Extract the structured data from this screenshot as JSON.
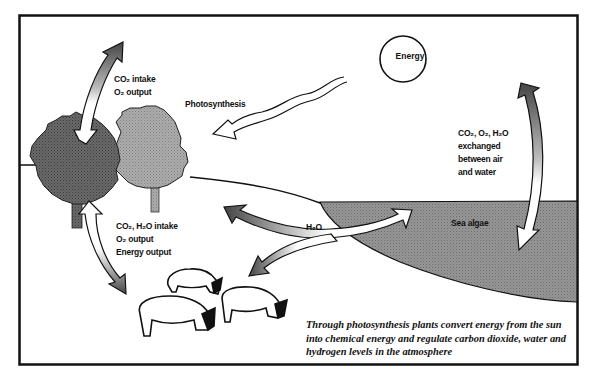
{
  "diagram": {
    "colors": {
      "frame": "#111111",
      "tree_dark": "#5e5e5e",
      "tree_light": "#a4a4a4",
      "sea": "#8f8f8f",
      "arrow_fill": "#ffffff",
      "arrow_shade": "#4a4a4a",
      "outline": "#111111"
    },
    "labels": {
      "co2_intake_line1": "CO₂ intake",
      "co2_intake_line2": "O₂ output",
      "photosynthesis": "Photosynthesis",
      "energy": "Energy",
      "exchange_line1": "CO₂, O₂, H₂O",
      "exchange_line2": "exchanged",
      "exchange_line3": "between air",
      "exchange_line4": "and water",
      "animal_line1": "CO₂, H₂O intake",
      "animal_line2": "O₂ output",
      "animal_line3": "Energy output",
      "water": "H₂O",
      "sea_algae": "Sea algae"
    },
    "caption": "Through photosynthesis plants convert energy from the sun into chemical energy and regulate carbon dioxide, water and hydrogen levels in the atmosphere",
    "elements": [
      {
        "name": "energy-sun",
        "label": "Energy"
      },
      {
        "name": "photosynthesis-light-arrow",
        "direction": "sun to trees"
      },
      {
        "name": "tree-dark"
      },
      {
        "name": "tree-light"
      },
      {
        "name": "sea",
        "label": "Sea algae"
      },
      {
        "name": "sheep",
        "count": 3
      },
      {
        "name": "air-tree-arrow",
        "bidirectional": true
      },
      {
        "name": "tree-animals-arrow",
        "bidirectional": true
      },
      {
        "name": "air-sea-arrow",
        "bidirectional": true
      },
      {
        "name": "water-arrow",
        "label": "H₂O",
        "branches": [
          "trees",
          "sea",
          "animals"
        ]
      }
    ]
  }
}
